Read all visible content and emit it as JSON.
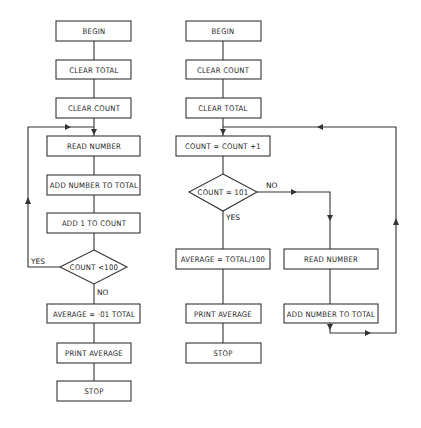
{
  "left_flowchart": {
    "nodes": [
      {
        "id": "begin",
        "label": "BEGIN",
        "shape": "rect"
      },
      {
        "id": "clear_total",
        "label": "CLEAR TOTAL",
        "shape": "rect"
      },
      {
        "id": "clear_count",
        "label": "CLEAR COUNT",
        "shape": "rect"
      },
      {
        "id": "read_number",
        "label": "READ NUMBER",
        "shape": "rect"
      },
      {
        "id": "add_number",
        "label": "ADD NUMBER TO TOTAL",
        "shape": "rect"
      },
      {
        "id": "add_one",
        "label": "ADD 1 TO COUNT",
        "shape": "rect"
      },
      {
        "id": "decision",
        "label": "COUNT <100",
        "shape": "diamond"
      },
      {
        "id": "average",
        "label": "AVERAGE = ·01 TOTAL",
        "shape": "rect"
      },
      {
        "id": "print",
        "label": "PRINT AVERAGE",
        "shape": "rect"
      },
      {
        "id": "stop",
        "label": "STOP",
        "shape": "rect"
      }
    ],
    "edge_labels": {
      "yes": "YES",
      "no": "NO"
    }
  },
  "right_flowchart": {
    "nodes": [
      {
        "id": "begin",
        "label": "BEGIN",
        "shape": "rect"
      },
      {
        "id": "clear_count",
        "label": "CLEAR COUNT",
        "shape": "rect"
      },
      {
        "id": "clear_total",
        "label": "CLEAR TOTAL",
        "shape": "rect"
      },
      {
        "id": "increment",
        "label": "COUNT = COUNT +1",
        "shape": "rect"
      },
      {
        "id": "decision",
        "label": "COUNT = 101",
        "shape": "diamond"
      },
      {
        "id": "average",
        "label": "AVERAGE = TOTAL/100",
        "shape": "rect"
      },
      {
        "id": "print",
        "label": "PRINT AVERAGE",
        "shape": "rect"
      },
      {
        "id": "stop",
        "label": "STOP",
        "shape": "rect"
      },
      {
        "id": "read_number",
        "label": "READ NUMBER",
        "shape": "rect"
      },
      {
        "id": "add_number",
        "label": "ADD NUMBER TO TOTAL",
        "shape": "rect"
      }
    ],
    "edge_labels": {
      "yes": "YES",
      "no": "NO"
    }
  }
}
